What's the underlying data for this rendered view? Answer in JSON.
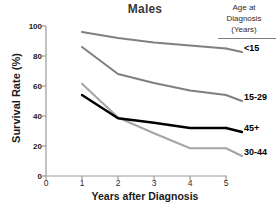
{
  "chart_data": {
    "type": "line",
    "title": "Males",
    "xlabel": "Years after Diagnosis",
    "ylabel": "Survival Rate (%)",
    "xlim": [
      0,
      5
    ],
    "ylim": [
      0,
      100
    ],
    "xticks": [
      "0",
      "1",
      "2",
      "3",
      "4",
      "5"
    ],
    "yticks": [
      "0",
      "20",
      "40",
      "60",
      "80",
      "100"
    ],
    "grid": false,
    "legend_position": "right",
    "legend_title_lines": [
      "Age at",
      "Diagnosis",
      "(Years)"
    ],
    "x": [
      1,
      2,
      3,
      4,
      5
    ],
    "series": [
      {
        "name": "<15",
        "color": "#808080",
        "values": [
          96,
          92,
          89,
          87,
          85
        ],
        "label_y": 48
      },
      {
        "name": "15-29",
        "color": "#808080",
        "values": [
          86,
          68,
          62,
          57,
          54
        ],
        "label_y": 97
      },
      {
        "name": "45+",
        "color": "#000000",
        "values": [
          54,
          38.5,
          35.5,
          32,
          32
        ],
        "label_y": 128
      },
      {
        "name": "30-44",
        "color": "#a6a6a6",
        "values": [
          61.5,
          39,
          28.5,
          18.5,
          18.5
        ],
        "label_y": 152
      }
    ]
  },
  "axis": {
    "y_title": "Survival Rate (%)",
    "x_title": "Years after Diagnosis"
  }
}
